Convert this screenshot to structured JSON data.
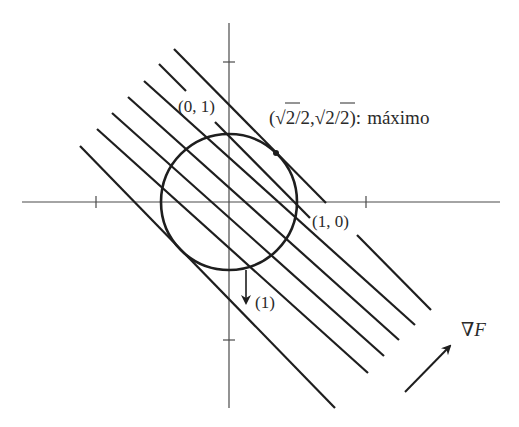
{
  "diagram": {
    "labels": {
      "point_top": "(0, 1)",
      "point_right": "(1, 0)",
      "maximum_point": "(√2/2, √2/2): máximo",
      "max_paren_open": "(",
      "sqrt_symbol": "√",
      "two": "2",
      "slash_two_comma": "/2,",
      "slash_two_close": "/2):",
      "maximo_word": "máximo",
      "arrow_label": "(1)",
      "gradient_label": "∇F",
      "nabla": "∇",
      "F": "F"
    },
    "elements": {
      "circle": "unit circle x²+y²=1",
      "level_lines": 7,
      "gradient_arrow_icon": "arrow-up-right",
      "normal_arrow_icon": "arrow-down"
    },
    "colors": {
      "line": "#1e1e1e",
      "axis": "#4a4a4a",
      "text": "#2a2a2a",
      "background": "#ffffff"
    }
  }
}
